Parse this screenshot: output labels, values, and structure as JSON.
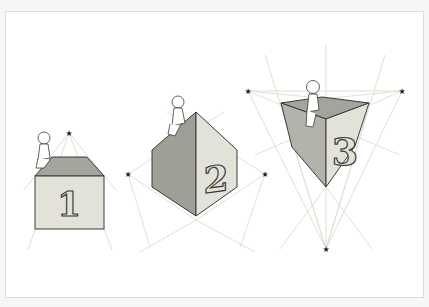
{
  "figure": {
    "colors": {
      "background": "#ffffff",
      "frame_border": "#dcdcda",
      "guide_line": "#dcdccf",
      "outline": "#3a3a3a",
      "face_light": "#e3e2d8",
      "face_mid": "#c2c1b8",
      "face_dark": "#9f9e97",
      "vanishing_point": "#222222"
    },
    "boxes": [
      {
        "label": "1",
        "perspective": "one-point",
        "vanishing_points": 1
      },
      {
        "label": "2",
        "perspective": "two-point",
        "vanishing_points": 2
      },
      {
        "label": "3",
        "perspective": "three-point",
        "vanishing_points": 3
      }
    ]
  }
}
